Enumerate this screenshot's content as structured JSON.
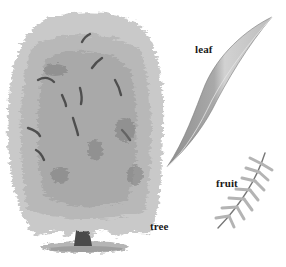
{
  "figure": {
    "style": "grayscale illustration",
    "labels": {
      "leaf": "leaf",
      "fruit": "fruit",
      "tree": "tree"
    },
    "colors": {
      "background": "#ffffff",
      "canopy_light": "#c9c9c9",
      "canopy_mid": "#a8a8a8",
      "canopy_dark": "#555555",
      "trunk": "#4a4a4a",
      "leaf_light": "#d2d2d2",
      "leaf_dark": "#8e8e8e",
      "label_text": "#1a1a1a"
    }
  }
}
